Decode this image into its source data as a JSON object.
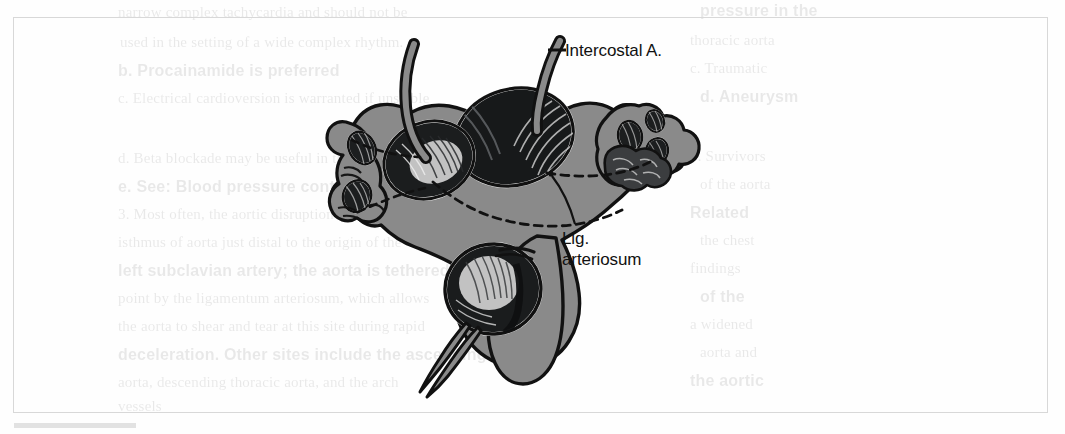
{
  "figure": {
    "kind": "anatomical-illustration",
    "fill_gray": "#8a8a8a",
    "line_black": "#111111",
    "frame_color": "#d8d8d8",
    "background": "#fefefe",
    "labels": [
      {
        "id": "intercostal",
        "text": "Intercostal A.",
        "lines": [
          "Intercostal A."
        ]
      },
      {
        "id": "lig",
        "text": "Lig. arteriosum",
        "lines": [
          "Lig.",
          "arteriosum"
        ]
      }
    ],
    "leaders": [
      {
        "for": "intercostal",
        "style": "short-dash"
      },
      {
        "for": "lig",
        "style": "solid-line"
      }
    ],
    "dashed_guides": 2
  },
  "labels": {
    "intercostal": "Intercostal A.",
    "lig_line1": "Lig.",
    "lig_line2": "arteriosum"
  },
  "bleed_text": {
    "lines": [
      {
        "x": 118,
        "y": 4,
        "t": "narrow complex tachycardia and should not be"
      },
      {
        "x": 700,
        "y": 2,
        "t": "pressure in the"
      },
      {
        "x": 120,
        "y": 34,
        "t": "used in the setting of a wide complex rhythm."
      },
      {
        "x": 690,
        "y": 32,
        "t": "thoracic aorta"
      },
      {
        "x": 118,
        "y": 62,
        "t": "b. Procainamide is preferred"
      },
      {
        "x": 690,
        "y": 60,
        "t": "c. Traumatic"
      },
      {
        "x": 118,
        "y": 90,
        "t": "c. Electrical cardioversion is warranted if unstable"
      },
      {
        "x": 700,
        "y": 88,
        "t": "d. Aneurysm"
      },
      {
        "x": 118,
        "y": 150,
        "t": "d. Beta blockade may be useful in this setting"
      },
      {
        "x": 690,
        "y": 148,
        "t": "5. Survivors"
      },
      {
        "x": 118,
        "y": 178,
        "t": "e. See: Blood pressure control"
      },
      {
        "x": 700,
        "y": 176,
        "t": "of the aorta"
      },
      {
        "x": 118,
        "y": 206,
        "t": "3. Most often, the aortic disruption occurs at the"
      },
      {
        "x": 690,
        "y": 204,
        "t": "Related"
      },
      {
        "x": 118,
        "y": 234,
        "t": "isthmus of aorta just distal to the origin of the"
      },
      {
        "x": 700,
        "y": 232,
        "t": "the chest"
      },
      {
        "x": 118,
        "y": 262,
        "t": "left subclavian artery; the aorta is tethered at this"
      },
      {
        "x": 690,
        "y": 260,
        "t": "findings"
      },
      {
        "x": 118,
        "y": 290,
        "t": "point by the ligamentum arteriosum, which allows"
      },
      {
        "x": 700,
        "y": 288,
        "t": "of the"
      },
      {
        "x": 118,
        "y": 318,
        "t": "the aorta to shear and tear at this site during rapid"
      },
      {
        "x": 690,
        "y": 316,
        "t": "a widened"
      },
      {
        "x": 118,
        "y": 346,
        "t": "deceleration. Other sites include the ascending"
      },
      {
        "x": 700,
        "y": 344,
        "t": "aorta and"
      },
      {
        "x": 118,
        "y": 374,
        "t": "aorta, descending thoracic aorta, and the arch"
      },
      {
        "x": 690,
        "y": 372,
        "t": "the aortic"
      },
      {
        "x": 118,
        "y": 398,
        "t": "vessels"
      }
    ]
  }
}
